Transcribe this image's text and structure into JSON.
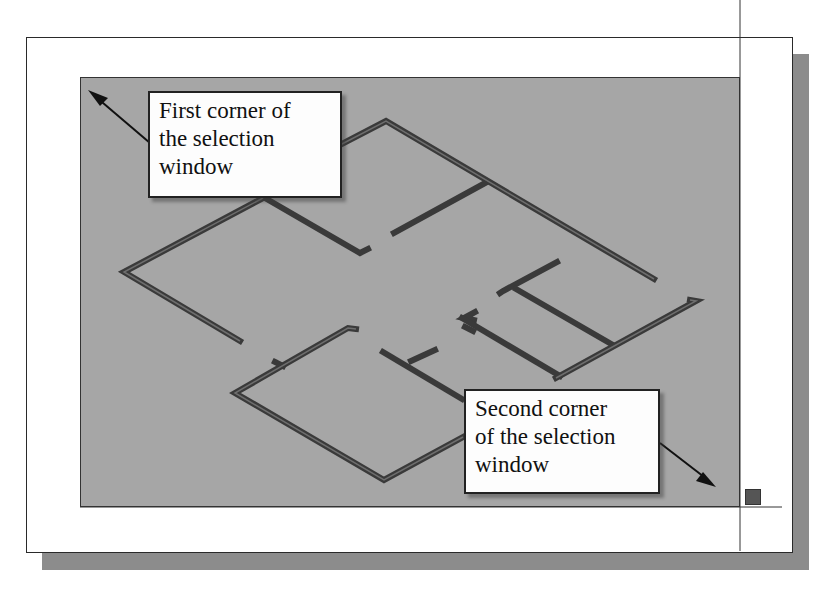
{
  "callouts": {
    "first": {
      "lines": [
        "First corner of",
        "the selection",
        "window"
      ]
    },
    "second": {
      "lines": [
        "Second corner",
        "of the selection",
        "window"
      ]
    }
  },
  "colors": {
    "viewport_bg": "#a6a6a6",
    "wall": "#3a3a3a",
    "wall_inner": "#6e6e6e",
    "frame_shadow": "#8c8c8c",
    "callout_bg": "#fdfdfd"
  },
  "icons": {
    "first_arrow": "arrow-up-left",
    "second_arrow": "arrow-down-right",
    "grip": "square-grip",
    "crosshair": "crosshair-cursor"
  }
}
